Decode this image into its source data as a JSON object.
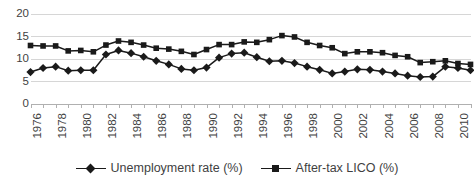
{
  "chart_data": {
    "type": "line",
    "title": "",
    "xlabel": "",
    "ylabel": "",
    "ylim": [
      0,
      20
    ],
    "yticks": [
      0,
      5,
      10,
      15,
      20
    ],
    "ytick_labels": [
      "0",
      "5",
      "10",
      "15",
      "20"
    ],
    "grid": "horizontal",
    "legend_position": "bottom",
    "x": [
      1976,
      1977,
      1978,
      1979,
      1980,
      1981,
      1982,
      1983,
      1984,
      1985,
      1986,
      1987,
      1988,
      1989,
      1990,
      1991,
      1992,
      1993,
      1994,
      1995,
      1996,
      1997,
      1998,
      1999,
      2000,
      2001,
      2002,
      2003,
      2004,
      2005,
      2006,
      2007,
      2008,
      2009,
      2010,
      2011
    ],
    "xtick_labels": [
      "1976",
      "1978",
      "1980",
      "1982",
      "1984",
      "1986",
      "1988",
      "1990",
      "1992",
      "1994",
      "1996",
      "1998",
      "2000",
      "2002",
      "2004",
      "2006",
      "2008",
      "2010"
    ],
    "xtick_years": [
      1976,
      1978,
      1980,
      1982,
      1984,
      1986,
      1988,
      1990,
      1992,
      1994,
      1996,
      1998,
      2000,
      2002,
      2004,
      2006,
      2008,
      2010
    ],
    "series": [
      {
        "name": "Unemployment rate (%)",
        "marker": "diamond",
        "color": "#1a1a1a",
        "values": [
          7.1,
          8.0,
          8.3,
          7.4,
          7.5,
          7.5,
          11.0,
          11.9,
          11.3,
          10.5,
          9.6,
          8.8,
          7.8,
          7.5,
          8.1,
          10.3,
          11.2,
          11.4,
          10.4,
          9.5,
          9.6,
          9.1,
          8.3,
          7.6,
          6.8,
          7.2,
          7.7,
          7.6,
          7.2,
          6.8,
          6.3,
          6.0,
          6.1,
          8.3,
          8.0,
          7.5
        ]
      },
      {
        "name": "After-tax LICO (%)",
        "marker": "square",
        "color": "#1a1a1a",
        "values": [
          13.0,
          12.9,
          12.9,
          11.8,
          11.9,
          11.6,
          13.1,
          14.0,
          13.7,
          13.1,
          12.4,
          12.2,
          11.7,
          11.0,
          12.1,
          13.2,
          13.2,
          13.8,
          13.7,
          14.3,
          15.2,
          14.9,
          13.7,
          13.0,
          12.5,
          11.2,
          11.6,
          11.6,
          11.4,
          10.8,
          10.5,
          9.2,
          9.4,
          9.6,
          9.0,
          8.8
        ]
      }
    ]
  },
  "legend": {
    "items": [
      {
        "label": "Unemployment rate (%)",
        "marker": "diamond"
      },
      {
        "label": "After-tax LICO (%)",
        "marker": "square"
      }
    ]
  }
}
